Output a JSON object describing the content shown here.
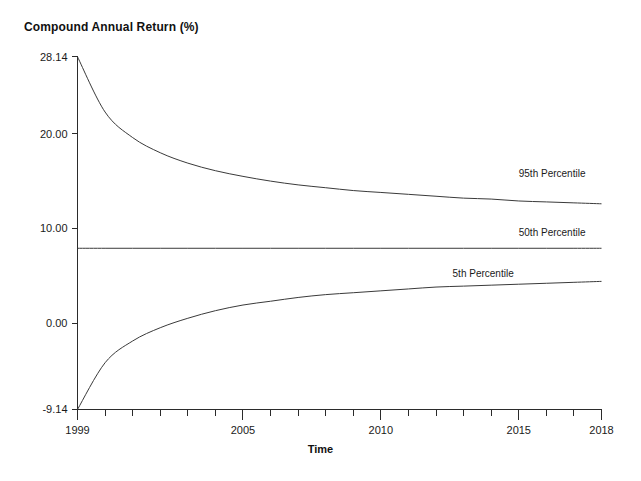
{
  "chart_data": {
    "type": "line",
    "title": "Compound Annual Return (%)",
    "xlabel": "Time",
    "ylabel": "Compound Annual Return (%)",
    "xlim": [
      1999,
      2018
    ],
    "ylim": [
      -9.14,
      28.14
    ],
    "grid": false,
    "legend_position": "inline-right",
    "y_ticks": [
      {
        "value": 28.14,
        "label": "28.14"
      },
      {
        "value": 20.0,
        "label": "20.00"
      },
      {
        "value": 10.0,
        "label": "10.00"
      },
      {
        "value": 0.0,
        "label": "0.00"
      },
      {
        "value": -9.14,
        "label": "-9.14"
      }
    ],
    "x_ticks": [
      {
        "value": 1999,
        "label": "1999"
      },
      {
        "value": 2000,
        "label": ""
      },
      {
        "value": 2001,
        "label": ""
      },
      {
        "value": 2002,
        "label": ""
      },
      {
        "value": 2003,
        "label": ""
      },
      {
        "value": 2004,
        "label": ""
      },
      {
        "value": 2005,
        "label": "2005"
      },
      {
        "value": 2006,
        "label": ""
      },
      {
        "value": 2007,
        "label": ""
      },
      {
        "value": 2008,
        "label": ""
      },
      {
        "value": 2009,
        "label": ""
      },
      {
        "value": 2010,
        "label": "2010"
      },
      {
        "value": 2011,
        "label": ""
      },
      {
        "value": 2012,
        "label": ""
      },
      {
        "value": 2013,
        "label": ""
      },
      {
        "value": 2014,
        "label": ""
      },
      {
        "value": 2015,
        "label": "2015"
      },
      {
        "value": 2016,
        "label": ""
      },
      {
        "value": 2017,
        "label": ""
      },
      {
        "value": 2018,
        "label": "2018"
      }
    ],
    "x": [
      1999,
      2000,
      2001,
      2002,
      2003,
      2004,
      2005,
      2006,
      2007,
      2008,
      2009,
      2010,
      2011,
      2012,
      2013,
      2014,
      2015,
      2016,
      2017,
      2018
    ],
    "series": [
      {
        "name": "95th Percentile",
        "color": "#3a3a3a",
        "label_x": 2015.0,
        "label_y": 15.6,
        "values": [
          28.14,
          22.3,
          19.6,
          18.0,
          16.9,
          16.1,
          15.5,
          15.0,
          14.6,
          14.3,
          14.0,
          13.8,
          13.6,
          13.4,
          13.2,
          13.1,
          12.9,
          12.8,
          12.7,
          12.6
        ]
      },
      {
        "name": "50th Percentile",
        "color": "#8a8a8a",
        "label_x": 2015.0,
        "label_y": 9.4,
        "values": [
          7.9,
          7.9,
          7.9,
          7.9,
          7.9,
          7.9,
          7.9,
          7.9,
          7.9,
          7.9,
          7.9,
          7.9,
          7.9,
          7.9,
          7.9,
          7.9,
          7.9,
          7.9,
          7.9,
          7.9
        ]
      },
      {
        "name": "5th Percentile",
        "color": "#3a3a3a",
        "label_x": 2012.6,
        "label_y": 5.1,
        "values": [
          -9.14,
          -4.2,
          -1.9,
          -0.5,
          0.5,
          1.3,
          1.9,
          2.3,
          2.7,
          3.0,
          3.2,
          3.4,
          3.6,
          3.8,
          3.9,
          4.0,
          4.1,
          4.2,
          4.3,
          4.4
        ]
      }
    ]
  }
}
